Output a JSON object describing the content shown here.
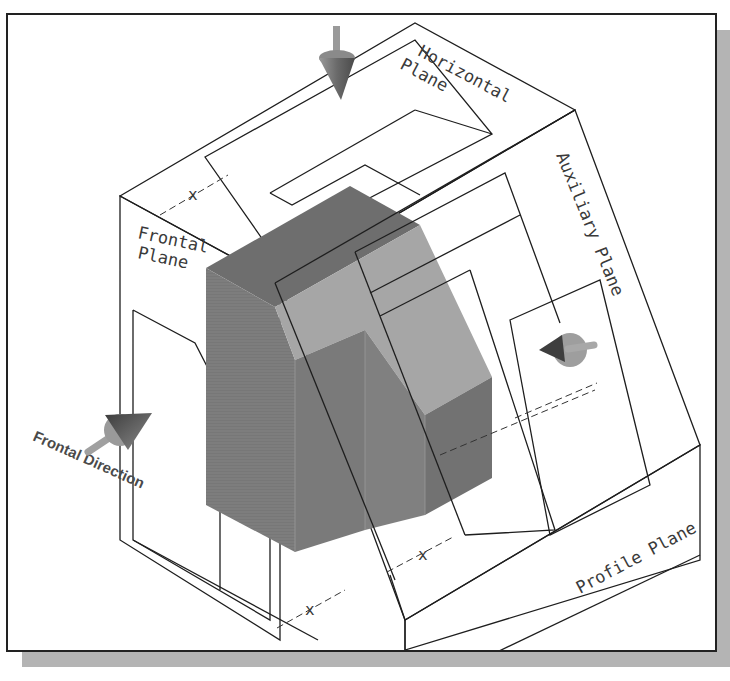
{
  "figure": {
    "type": "isometric projection planes illustration",
    "labels": {
      "horizontal_plane_line1": "Horizontal",
      "horizontal_plane_line2": "Plane",
      "frontal_plane_line1": "Frontal",
      "frontal_plane_line2": "Plane",
      "auxiliary_plane": "Auxiliary Plane",
      "profile_plane": "Profile Plane",
      "frontal_direction": "Frontal Direction"
    },
    "dimensions": {
      "top_dim": "x",
      "bottom_left_dim": "x",
      "bottom_right_dim": "x"
    },
    "colors": {
      "solid_dark": "#7d7d7d",
      "solid_light": "#a8a8a8",
      "solid_top": "#6e6e6e",
      "line": "#1e1e1e",
      "shadow": "#b4b4b4",
      "arrow": "#8a8a8a"
    },
    "arrows": [
      {
        "name": "horizontal-direction-arrow",
        "direction": "down"
      },
      {
        "name": "frontal-direction-arrow",
        "direction": "right"
      },
      {
        "name": "auxiliary-direction-arrow",
        "direction": "left"
      }
    ]
  }
}
